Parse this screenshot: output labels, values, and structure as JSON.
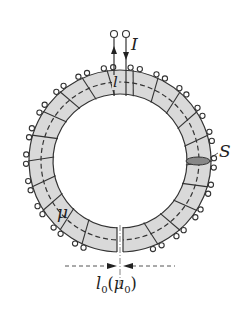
{
  "diagram": {
    "labels": {
      "current": "I",
      "mean_path": "l",
      "cross_section": "S",
      "permeability": "μ",
      "gap_length": "l",
      "gap_subscript": "0",
      "gap_perm_open": "(",
      "gap_perm": "μ",
      "gap_perm_subscript": "0",
      "gap_perm_close": ")"
    },
    "colors": {
      "core_fill": "#d9d9d9",
      "stroke": "#333333",
      "background": "#ffffff"
    },
    "geometry": {
      "center": [
        120,
        161
      ],
      "outer_radius": 91,
      "inner_radius": 67,
      "winding_count": 22
    }
  }
}
